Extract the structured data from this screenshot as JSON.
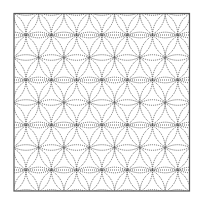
{
  "diagram": {
    "type": "geometric-pattern",
    "frame": {
      "x": 14,
      "y": 13.5,
      "width": 175.5,
      "height": 177.5,
      "stroke": "#555555"
    },
    "lattice": {
      "origin_x": 26,
      "origin_y": 35,
      "spacing": 25.3,
      "row_height": 22.5
    },
    "circle_stroke": "#444444",
    "guide_line_rows_y": [
      35,
      80,
      125,
      170
    ]
  }
}
